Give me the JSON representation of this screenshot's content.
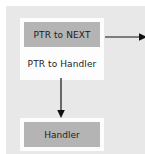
{
  "diagram": {
    "panel": {
      "background_color": "#e8e8e8"
    },
    "node": {
      "container_background": "#fdfdfd",
      "fields": [
        {
          "label": "PTR to NEXT",
          "fill": "filled",
          "fill_color": "#b4b4b4"
        },
        {
          "label": "PTR to Handler",
          "fill": "hollow",
          "fill_color": "#fdfdfd"
        }
      ]
    },
    "handler": {
      "label": "Handler",
      "fill_color": "#b4b4b4",
      "container_background": "#fdfdfd"
    },
    "arrows": [
      {
        "name": "next-pointer-arrow",
        "direction": "right",
        "color": "#111111"
      },
      {
        "name": "handler-pointer-arrow",
        "direction": "down",
        "color": "#111111"
      }
    ]
  }
}
